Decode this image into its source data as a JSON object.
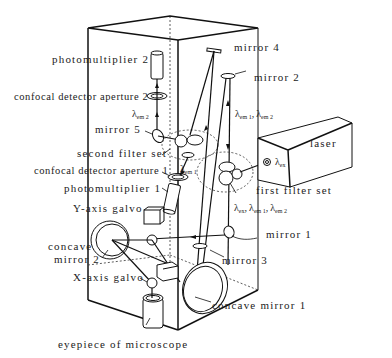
{
  "diagram": {
    "type": "confocal microscope optical schematic",
    "labels": {
      "photomultiplier_2": "photomultiplier   2",
      "confocal_aperture_2": "confocal detector aperture   2",
      "mirror_5": "mirror   5",
      "second_filter_set": "second   filter   set",
      "confocal_aperture_1": "confocal detector aperture   1",
      "photomultiplier_1": "photomultiplier   1",
      "y_axis_galvo": "Y-axis   galvo",
      "concave_mirror_2_a": "concave",
      "concave_mirror_2_b": "mirror   2",
      "x_axis_galvo": "X-axis   galvo",
      "eyepiece": "eyepiece   of   microscope",
      "mirror_4": "mirror   4",
      "mirror_2": "mirror   2",
      "laser": "laser",
      "first_filter_set": "first   filter   set",
      "mirror_1": "mirror   1",
      "mirror_3": "mirror   3",
      "concave_mirror_1": "concave   mirror   1"
    },
    "wavelengths": {
      "lambda": "λ",
      "em2_sub": "em 2",
      "em1_sub": "em 1",
      "ex_sub": "ex",
      "em1_em2_top_a": "em 1",
      "em1_em2_top_b": "em 2",
      "sep": ",",
      "ex_em1_em2_ex": "ex",
      "ex_em1_em2_em1": "em 1",
      "ex_em1_em2_em2": "em 2"
    }
  }
}
